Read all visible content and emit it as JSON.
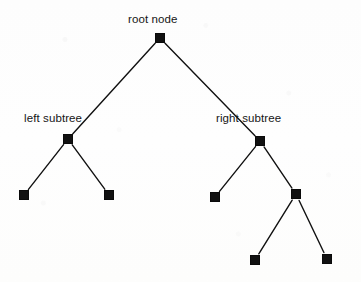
{
  "diagram": {
    "type": "binary-tree",
    "background_color": "#fdfdfd",
    "node_color": "#111111",
    "edge_color": "#111111",
    "text_color": "#151515",
    "labels": [
      {
        "id": "label-root",
        "text": "root node",
        "x": 128,
        "y": 13
      },
      {
        "id": "label-left",
        "text": "left subtree",
        "x": 24,
        "y": 112
      },
      {
        "id": "label-right",
        "text": "right subtree",
        "x": 216,
        "y": 112
      }
    ],
    "nodes": [
      {
        "id": "root",
        "label": "root node",
        "cx": 160,
        "cy": 38,
        "size": 10
      },
      {
        "id": "left",
        "label": "left subtree",
        "cx": 68,
        "cy": 139,
        "size": 10
      },
      {
        "id": "right",
        "label": "right subtree",
        "cx": 260,
        "cy": 141,
        "size": 10
      },
      {
        "id": "left-left",
        "label": "",
        "cx": 24,
        "cy": 195,
        "size": 10
      },
      {
        "id": "left-right",
        "label": "",
        "cx": 109,
        "cy": 195,
        "size": 10
      },
      {
        "id": "right-left",
        "label": "",
        "cx": 215,
        "cy": 197,
        "size": 10
      },
      {
        "id": "right-right",
        "label": "",
        "cx": 296,
        "cy": 194,
        "size": 10
      },
      {
        "id": "rr-left",
        "label": "",
        "cx": 255,
        "cy": 260,
        "size": 10
      },
      {
        "id": "rr-right",
        "label": "",
        "cx": 327,
        "cy": 259,
        "size": 10
      }
    ],
    "edges": [
      {
        "id": "edge-root-left",
        "from": "root",
        "to": "left"
      },
      {
        "id": "edge-root-right",
        "from": "root",
        "to": "right"
      },
      {
        "id": "edge-left-leftleft",
        "from": "left",
        "to": "left-left"
      },
      {
        "id": "edge-left-leftright",
        "from": "left",
        "to": "left-right"
      },
      {
        "id": "edge-right-rightleft",
        "from": "right",
        "to": "right-left"
      },
      {
        "id": "edge-right-rightright",
        "from": "right",
        "to": "right-right"
      },
      {
        "id": "edge-rightright-rrleft",
        "from": "right-right",
        "to": "rr-left"
      },
      {
        "id": "edge-rightright-rrright",
        "from": "right-right",
        "to": "rr-right"
      }
    ]
  }
}
